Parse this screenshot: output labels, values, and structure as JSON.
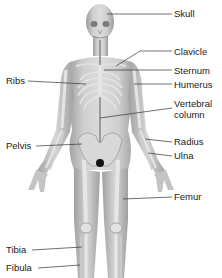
{
  "diagram": {
    "type": "labeled anatomical illustration",
    "colors": {
      "body": "#c9c9c9",
      "bone": "#e6e6e6",
      "shadow": "#8f8f8f",
      "leader_line": "#333333",
      "text": "#1a1a1a"
    },
    "labels_right": [
      {
        "text": "Skull",
        "x": 174,
        "y": 9,
        "target": [
          107,
          14
        ]
      },
      {
        "text": "Clavicle",
        "x": 174,
        "y": 47,
        "target": [
          116,
          66
        ]
      },
      {
        "text": "Sternum",
        "x": 174,
        "y": 66,
        "target": [
          104,
          70
        ]
      },
      {
        "text": "Humerus",
        "x": 174,
        "y": 80,
        "target": [
          134,
          84
        ]
      },
      {
        "text": "Vertebral",
        "line2": "column",
        "x": 174,
        "y": 100,
        "target": [
          100,
          118
        ]
      },
      {
        "text": "Radius",
        "x": 174,
        "y": 138,
        "target": [
          145,
          139
        ]
      },
      {
        "text": "Ulna",
        "x": 174,
        "y": 152,
        "target": [
          148,
          153
        ]
      },
      {
        "text": "Femur",
        "x": 174,
        "y": 193,
        "target": [
          123,
          199
        ]
      }
    ],
    "labels_left": [
      {
        "text": "Ribs",
        "x": 6,
        "y": 77,
        "target": [
          86,
          84
        ]
      },
      {
        "text": "Pelvis",
        "x": 6,
        "y": 142,
        "target": [
          82,
          144
        ]
      },
      {
        "text": "Tibia",
        "x": 6,
        "y": 246,
        "target": [
          82,
          247
        ]
      },
      {
        "text": "Fibula",
        "x": 6,
        "y": 264,
        "target": [
          80,
          265
        ]
      }
    ]
  }
}
